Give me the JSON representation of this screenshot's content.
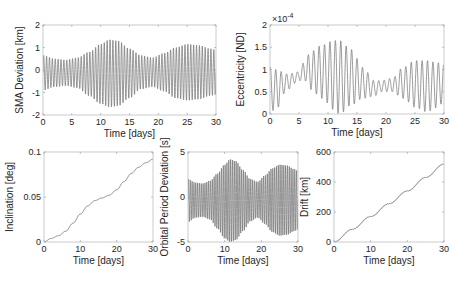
{
  "chart_data": [
    {
      "id": "sma",
      "type": "line",
      "title": "",
      "xlabel": "Time [days]",
      "ylabel": "SMA Deviation [km]",
      "xlim": [
        0,
        30
      ],
      "ylim": [
        -2,
        2
      ],
      "xticks": [
        0,
        5,
        10,
        15,
        20,
        25,
        30
      ],
      "yticks": [
        -2,
        -1,
        0,
        1,
        2
      ],
      "grid": false,
      "color": "#6e6e6e",
      "box": [
        43,
        25,
        216,
        115
      ],
      "signal": {
        "kind": "oscillation",
        "cycles_per_day": 2.0,
        "offset": 0,
        "envelope_x": [
          0,
          2,
          4,
          6,
          8,
          10,
          11.5,
          13,
          15,
          17,
          19,
          21,
          23,
          25,
          27,
          29,
          30
        ],
        "envelope_upper": [
          0.65,
          0.5,
          0.45,
          0.55,
          0.8,
          1.15,
          1.35,
          1.3,
          0.95,
          0.65,
          0.55,
          0.75,
          1.0,
          1.15,
          1.1,
          0.95,
          0.9
        ],
        "envelope_lower": [
          -0.9,
          -0.75,
          -0.7,
          -0.8,
          -1.15,
          -1.5,
          -1.65,
          -1.6,
          -1.25,
          -0.85,
          -0.75,
          -0.95,
          -1.25,
          -1.35,
          -1.3,
          -1.15,
          -1.1
        ]
      }
    },
    {
      "id": "eccentricity",
      "type": "line",
      "title": "",
      "xlabel": "Time [days]",
      "ylabel": "Eccentricity [ND]",
      "yscale_label": "×10",
      "yscale_exp": "-4",
      "xlim": [
        0,
        30
      ],
      "ylim": [
        0,
        2
      ],
      "xticks": [
        0,
        5,
        10,
        15,
        20,
        25,
        30
      ],
      "yticks": [
        0,
        0.5,
        1,
        1.5,
        2
      ],
      "grid": false,
      "color": "#6e6e6e",
      "box": [
        270,
        25,
        444,
        114
      ],
      "signal": {
        "kind": "oscillation",
        "cycles_per_day": 1.07,
        "envelope_x": [
          0,
          1,
          3,
          5,
          6,
          7,
          9,
          11,
          12,
          14,
          16,
          18,
          19,
          21,
          23,
          25,
          27,
          29,
          30
        ],
        "envelope_upper": [
          1.05,
          1.0,
          0.9,
          0.95,
          1.2,
          1.4,
          1.55,
          1.65,
          1.65,
          1.45,
          1.05,
          0.75,
          0.75,
          0.8,
          1.05,
          1.2,
          1.2,
          1.15,
          1.1
        ],
        "envelope_lower": [
          0.05,
          0.1,
          0.55,
          0.75,
          0.75,
          0.55,
          0.35,
          0.1,
          0.0,
          0.2,
          0.35,
          0.4,
          0.5,
          0.5,
          0.35,
          0.15,
          0.05,
          0.15,
          0.3
        ]
      }
    },
    {
      "id": "inclination",
      "type": "line",
      "title": "",
      "xlabel": "Time [days]",
      "ylabel": "Inclination [deg]",
      "xlim": [
        0,
        30
      ],
      "ylim": [
        0,
        0.1
      ],
      "xticks": [
        0,
        10,
        20,
        30
      ],
      "yticks": [
        0,
        0.05,
        0.1
      ],
      "grid": false,
      "color": "#6e6e6e",
      "box": [
        44,
        152,
        153,
        242
      ],
      "x": [
        0,
        2,
        4,
        6,
        8,
        10,
        12,
        14,
        16,
        18,
        20,
        22,
        24,
        26,
        28,
        30
      ],
      "values": [
        0.0,
        0.004,
        0.007,
        0.012,
        0.021,
        0.031,
        0.04,
        0.046,
        0.049,
        0.052,
        0.058,
        0.067,
        0.076,
        0.083,
        0.088,
        0.092
      ]
    },
    {
      "id": "orbital_period",
      "type": "line",
      "title": "",
      "xlabel": "Time [days]",
      "ylabel": "Orbital Period Deviation [s]",
      "xlim": [
        0,
        30
      ],
      "ylim": [
        -5,
        5
      ],
      "xticks": [
        0,
        10,
        20,
        30
      ],
      "yticks": [
        -5,
        0,
        5
      ],
      "grid": false,
      "color": "#6e6e6e",
      "box": [
        188,
        152,
        298,
        242
      ],
      "signal": {
        "kind": "oscillation",
        "cycles_per_day": 2.0,
        "envelope_x": [
          0,
          2,
          4,
          6,
          8,
          10,
          11.5,
          13,
          15,
          17,
          19,
          21,
          23,
          25,
          27,
          29,
          30
        ],
        "envelope_upper": [
          2.0,
          1.6,
          1.5,
          1.8,
          2.6,
          3.6,
          4.2,
          4.0,
          3.0,
          2.0,
          1.7,
          2.4,
          3.2,
          3.6,
          3.5,
          3.1,
          2.9
        ],
        "envelope_lower": [
          -2.8,
          -2.3,
          -2.2,
          -2.5,
          -3.5,
          -4.6,
          -5.0,
          -4.8,
          -3.8,
          -2.7,
          -2.3,
          -3.0,
          -3.9,
          -4.3,
          -4.2,
          -3.8,
          -3.6
        ]
      }
    },
    {
      "id": "drift",
      "type": "line",
      "title": "",
      "xlabel": "Time [days]",
      "ylabel": "Drift [km]",
      "xlim": [
        0,
        30
      ],
      "ylim": [
        0,
        600
      ],
      "xticks": [
        0,
        10,
        20,
        30
      ],
      "yticks": [
        0,
        200,
        400,
        600
      ],
      "grid": false,
      "color": "#6e6e6e",
      "box": [
        334,
        152,
        444,
        242
      ],
      "x": [
        0,
        5,
        10,
        15,
        20,
        25,
        30
      ],
      "values": [
        0,
        85,
        170,
        255,
        340,
        430,
        520
      ]
    }
  ]
}
